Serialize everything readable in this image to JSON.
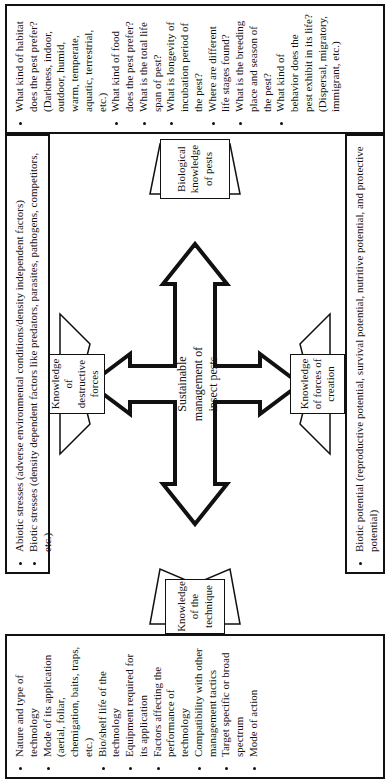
{
  "diagram": {
    "center": "Sustainable management of insect pests",
    "nodes": {
      "top": "Biological knowledge of pests",
      "left": "Knowledge of the technique",
      "upper_left": "Knowledge of destructive forces",
      "lower_right": "Knowledge of forces of creation"
    },
    "boxes": {
      "biology": [
        "What kind of habitat does the pest prefer? (Darkness, indoor, outdoor, humid, warm, temperate, aquatic, terrestrial, etc.)",
        "What kind of food does the pest prefer?",
        "What is the total life span of pest?",
        "What is longevity of incubation period of the pest?",
        "Where are different life stages found?",
        "What is the breeding place and season of the pest?",
        "What kind of behavior does the pest exhibit in its life?(Dispersal, migratory, immigrant, etc.)"
      ],
      "destructive": [
        "Abiotic stresses (adverse environmental conditions/density independent factors)",
        "Biotic stresses (density dependent factors like predators, parasites, pathogens, competitors, etc.)"
      ],
      "creation": [
        "Biotic potential (reproductive potential, survival potential, nutritive potential, and protective potential)"
      ],
      "technique": [
        "Nature and type of technology",
        "Mode of its application (aerial, foliar, chemigation, baits, traps, etc.)",
        "Bio/shelf life of the technology",
        "Equipment required for its application",
        "Factors affecting the performance of technology",
        "Compatibility with other management tactics",
        "Target specific or broad spectrum",
        "Mode of action"
      ]
    }
  }
}
